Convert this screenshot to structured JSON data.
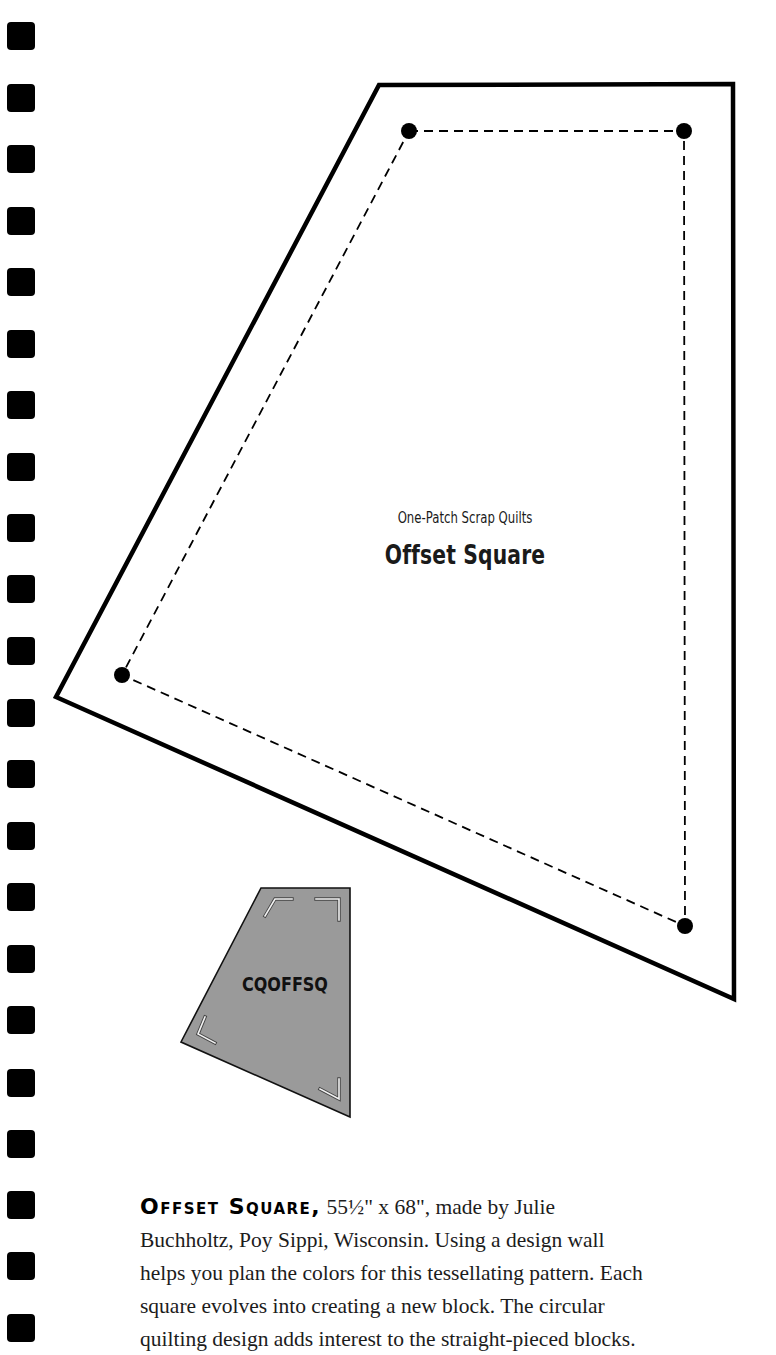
{
  "binder": {
    "hole_count": 22,
    "hole_tops": [
      22,
      84,
      145,
      207,
      268,
      330,
      391,
      453,
      514,
      575,
      637,
      699,
      760,
      822,
      883,
      945,
      1006,
      1069,
      1130,
      1191,
      1252,
      1314
    ]
  },
  "template": {
    "series_label": "One-Patch Scrap Quilts",
    "block_name": "Offset Square",
    "outer_outline_points": [
      [
        379,
        85
      ],
      [
        733,
        84
      ],
      [
        734,
        999
      ],
      [
        56,
        697
      ]
    ],
    "seam_line_points": [
      [
        409,
        131
      ],
      [
        684,
        131
      ],
      [
        685,
        926
      ],
      [
        122,
        675
      ]
    ],
    "seam_style": "dashed",
    "outline_color": "#000000"
  },
  "thumbnail": {
    "code": "CQOFFSQ",
    "points": [
      [
        261,
        888
      ],
      [
        350,
        888
      ],
      [
        350,
        1117
      ],
      [
        181,
        1042
      ]
    ],
    "fill_color": "#9a9a9a"
  },
  "caption": {
    "title": "Offset Square,",
    "lines": [
      " 55½\" x 68\", made by Julie",
      "Buchholtz, Poy Sippi, Wisconsin. Using a design wall",
      "helps you plan the colors for this tessellating pattern. Each",
      "square evolves into creating a new block. The circular",
      "quilting design adds interest to the straight-pieced blocks."
    ]
  }
}
